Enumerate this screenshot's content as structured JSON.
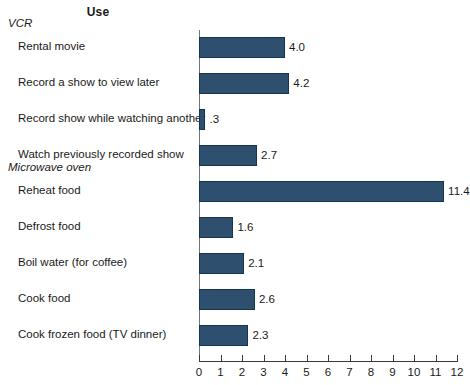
{
  "chart_data": {
    "type": "bar",
    "orientation": "horizontal",
    "title": "Use",
    "xlabel": "",
    "ylabel": "",
    "xlim": [
      0,
      12
    ],
    "grid": false,
    "legend": null,
    "tick_labels": [
      "0",
      "1",
      "2",
      "3",
      "4",
      "5",
      "6",
      "7",
      "8",
      "9",
      "10",
      "11",
      "12"
    ],
    "ticks": [
      0,
      1,
      2,
      3,
      4,
      5,
      6,
      7,
      8,
      9,
      10,
      11,
      12
    ],
    "groups": [
      {
        "name": "VCR",
        "items": [
          {
            "label": "Rental movie",
            "value": 4.0,
            "value_label": "4.0"
          },
          {
            "label": "Record a show to view later",
            "value": 4.2,
            "value_label": "4.2"
          },
          {
            "label": "Record show while watching another",
            "value": 0.3,
            "value_label": ".3"
          },
          {
            "label": "Watch previously recorded show",
            "value": 2.7,
            "value_label": "2.7"
          }
        ]
      },
      {
        "name": "Microwave oven",
        "items": [
          {
            "label": "Reheat food",
            "value": 11.4,
            "value_label": "11.4"
          },
          {
            "label": "Defrost food",
            "value": 1.6,
            "value_label": "1.6"
          },
          {
            "label": "Boil water (for coffee)",
            "value": 2.1,
            "value_label": "2.1"
          },
          {
            "label": "Cook food",
            "value": 2.6,
            "value_label": "2.6"
          },
          {
            "label": "Cook frozen food (TV dinner)",
            "value": 2.3,
            "value_label": "2.3"
          }
        ]
      }
    ],
    "categories": [
      "Rental movie",
      "Record a show to view later",
      "Record show while watching another",
      "Watch previously recorded show",
      "Reheat food",
      "Defrost food",
      "Boil water (for coffee)",
      "Cook food",
      "Cook frozen food (TV dinner)"
    ],
    "values": [
      4.0,
      4.2,
      0.3,
      2.7,
      11.4,
      1.6,
      2.1,
      2.6,
      2.3
    ],
    "colors": {
      "bar_fill": "#2f4f6e",
      "bar_stroke": "#14344f",
      "axis": "#3a3a3a",
      "text": "#1a1a1a",
      "background": "#ffffff"
    }
  }
}
